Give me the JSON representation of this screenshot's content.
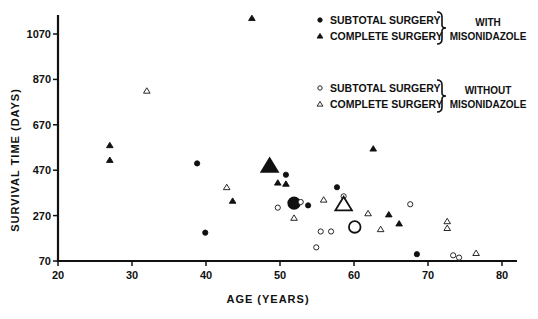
{
  "chart_data": {
    "type": "scatter",
    "title": "",
    "xlabel": "AGE (YEARS)",
    "ylabel": "SURVIVAL TIME (DAYS)",
    "xlim": [
      20,
      82
    ],
    "ylim": [
      70,
      1160
    ],
    "xticks": [
      20,
      30,
      40,
      50,
      60,
      70,
      80
    ],
    "yticks": [
      70,
      270,
      470,
      670,
      870,
      1070
    ],
    "grid": false,
    "legend_position": "upper right",
    "legend": {
      "groups": [
        {
          "label_lines": [
            "WITH",
            "MISONIDAZOLE"
          ],
          "entries": [
            {
              "marker": "filled-circle",
              "label": "SUBTOTAL SURGERY"
            },
            {
              "marker": "filled-triangle",
              "label": "COMPLETE SURGERY"
            }
          ]
        },
        {
          "label_lines": [
            "WITHOUT",
            "MISONIDAZOLE"
          ],
          "entries": [
            {
              "marker": "open-circle",
              "label": "SUBTOTAL SURGERY"
            },
            {
              "marker": "open-triangle",
              "label": "COMPLETE SURGERY"
            }
          ]
        }
      ]
    },
    "series": [
      {
        "name": "Subtotal surgery with misonidazole",
        "marker": "filled-circle",
        "points": [
          [
            38.8,
            500
          ],
          [
            39.9,
            195
          ],
          [
            50.8,
            450
          ],
          [
            53.8,
            315
          ],
          [
            57.7,
            395
          ],
          [
            68.5,
            100
          ]
        ],
        "mean": [
          51.9,
          325
        ]
      },
      {
        "name": "Complete surgery with misonidazole",
        "marker": "filled-triangle",
        "points": [
          [
            27.0,
            580
          ],
          [
            27.0,
            515
          ],
          [
            43.6,
            335
          ],
          [
            46.2,
            1140
          ],
          [
            49.7,
            415
          ],
          [
            50.8,
            410
          ],
          [
            62.6,
            565
          ],
          [
            64.7,
            275
          ],
          [
            66.1,
            235
          ]
        ],
        "mean": [
          48.6,
          490
        ]
      },
      {
        "name": "Subtotal surgery without misonidazole",
        "marker": "open-circle",
        "points": [
          [
            49.7,
            305
          ],
          [
            52.8,
            330
          ],
          [
            54.9,
            130
          ],
          [
            55.5,
            200
          ],
          [
            56.9,
            200
          ],
          [
            58.6,
            355
          ],
          [
            67.6,
            320
          ],
          [
            73.4,
            95
          ],
          [
            74.2,
            85
          ]
        ],
        "mean": [
          60.1,
          220
        ]
      },
      {
        "name": "Complete surgery without misonidazole",
        "marker": "open-triangle",
        "points": [
          [
            32.0,
            820
          ],
          [
            42.8,
            395
          ],
          [
            51.9,
            260
          ],
          [
            55.9,
            340
          ],
          [
            61.9,
            280
          ],
          [
            63.6,
            210
          ],
          [
            72.6,
            245
          ],
          [
            72.6,
            215
          ],
          [
            76.5,
            105
          ]
        ],
        "mean": [
          58.6,
          320
        ]
      }
    ]
  }
}
